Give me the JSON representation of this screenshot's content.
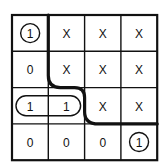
{
  "kmap": {
    "rows": 4,
    "cols": 4,
    "cells": [
      [
        "1",
        "X",
        "X",
        "X"
      ],
      [
        "0",
        "X",
        "X",
        "X"
      ],
      [
        "1",
        "1",
        "X",
        "X"
      ],
      [
        "0",
        "0",
        "0",
        "1"
      ]
    ],
    "circled_cells": [
      [
        0,
        0
      ],
      [
        3,
        3
      ]
    ],
    "grouped_pairs": [
      [
        [
          2,
          0
        ],
        [
          2,
          1
        ]
      ]
    ],
    "boundary_curve": "staircase separating 1/0 region (lower-left) from don't-care X region (upper-right)"
  },
  "colors": {
    "line": "#111111",
    "background": "#ffffff"
  }
}
